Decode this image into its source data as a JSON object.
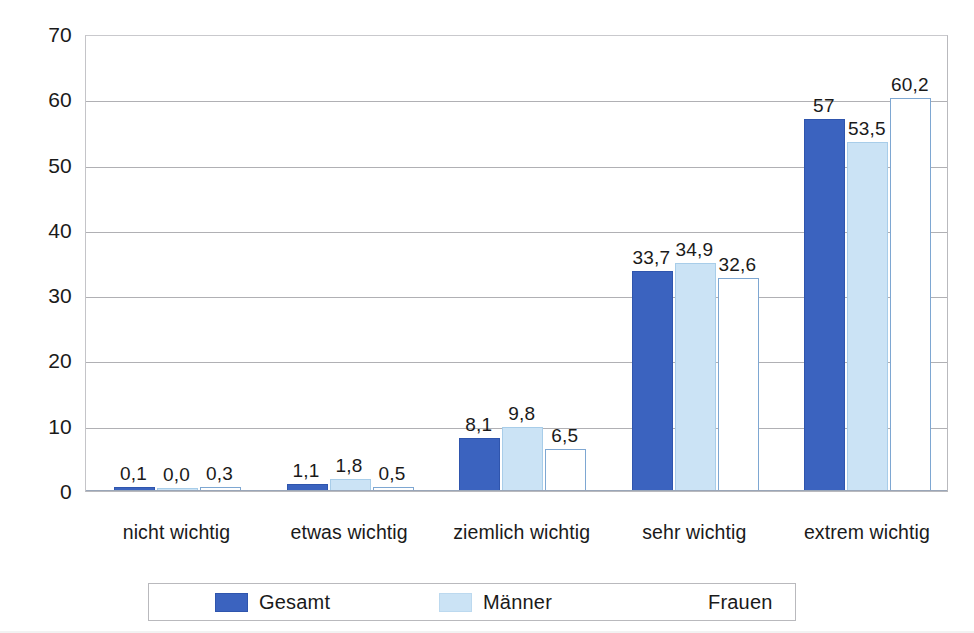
{
  "chart_data": {
    "type": "bar",
    "title": "",
    "subtitle": "",
    "xlabel": "",
    "ylabel": "",
    "ylim": [
      0,
      70
    ],
    "ytick_step": 10,
    "yticks": [
      "70",
      "60",
      "50",
      "40",
      "30",
      "20",
      "10",
      "0"
    ],
    "grid": true,
    "grid_axis": "y",
    "legend_position": "bottom",
    "decimal_separator": ",",
    "categories": [
      "nicht wichtig",
      "etwas wichtig",
      "ziemlich wichtig",
      "sehr wichtig",
      "extrem wichtig"
    ],
    "series": [
      {
        "name": "Gesamt",
        "color": "#3b63bf",
        "border_color": "#2f55ad",
        "values": [
          0.1,
          1.1,
          8.1,
          33.7,
          57.0
        ],
        "labels": [
          "0,1",
          "1,1",
          "8,1",
          "33,7",
          "57"
        ]
      },
      {
        "name": "Männer",
        "color": "#cbe3f5",
        "border_color": "#a8cde9",
        "values": [
          0.0,
          1.8,
          9.8,
          34.9,
          53.5
        ],
        "labels": [
          "0,0",
          "1,8",
          "9,8",
          "34,9",
          "53,5"
        ]
      },
      {
        "name": "Frauen",
        "color": "#ffffff",
        "border_color": "#7ea7d2",
        "values": [
          0.3,
          0.5,
          6.5,
          32.6,
          60.2
        ],
        "labels": [
          "0,3",
          "0,5",
          "6,5",
          "32,6",
          "60,2"
        ]
      }
    ]
  },
  "legend": {
    "entries": [
      {
        "label": "Gesamt",
        "swatch": "gesamt"
      },
      {
        "label": "Männer",
        "swatch": "maenner"
      },
      {
        "label": "Frauen",
        "swatch": "frauen"
      }
    ]
  },
  "colors": {
    "gesamt": "#3b63bf",
    "maenner": "#cbe3f5",
    "frauen": "#ffffff",
    "frauen_border": "#7ea7d2",
    "gridline": "#b0b0b4",
    "plot_border": "#b9b9bd",
    "text": "#1a1a1a",
    "background": "#ffffff"
  }
}
